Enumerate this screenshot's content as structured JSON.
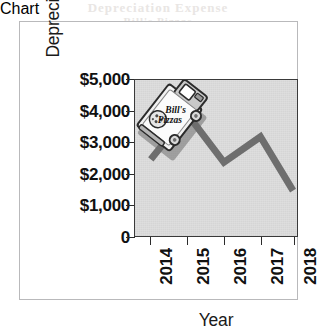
{
  "figure": {
    "bleed_through_top": "Depreciation Expense",
    "bleed_through_bottom": "Bill's Pizzas"
  },
  "chart_data": {
    "type": "line",
    "title": "",
    "xlabel": "Year",
    "ylabel": "Depreciation Expense",
    "categories": [
      "2014",
      "2015",
      "2016",
      "2017",
      "2018"
    ],
    "values": [
      2700,
      4300,
      2600,
      3500,
      1600
    ],
    "series": [
      {
        "name": "Depreciation Expense",
        "values": [
          2700,
          4300,
          2600,
          3500,
          1600
        ]
      }
    ],
    "ylim": [
      0,
      5500
    ],
    "ytick_values": [
      0,
      1000,
      2000,
      3000,
      4000,
      5000
    ],
    "ytick_labels": [
      "0",
      "$1,000",
      "$2,000",
      "$3,000",
      "$4,000",
      "$5,000"
    ],
    "xtick_labels": [
      "2014",
      "2015",
      "2016",
      "2017",
      "2018"
    ],
    "grid": false,
    "legend": false,
    "legend_position": "none",
    "line_color": "#6e6e6e",
    "plot_background": "#dedede",
    "axis_color": "#2b2b2b"
  },
  "annotation": {
    "truck": {
      "name": "bills-pizzas-delivery-truck",
      "brand_line1": "Bill's",
      "brand_line2": "Pizzas"
    }
  }
}
